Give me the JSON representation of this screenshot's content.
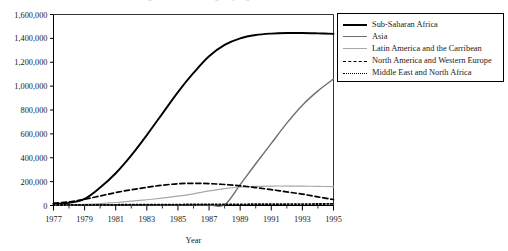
{
  "chart_data": {
    "type": "line",
    "title": "Figure 1. Number of Refugees by Region",
    "xlabel": "Year",
    "ylabel": "",
    "x": [
      1977,
      1978,
      1979,
      1980,
      1981,
      1982,
      1983,
      1984,
      1985,
      1986,
      1987,
      1988,
      1989,
      1990,
      1991,
      1992,
      1993,
      1994,
      1995
    ],
    "xlim": [
      1977,
      1995
    ],
    "ylim": [
      0,
      1600000
    ],
    "xticks": [
      1977,
      1979,
      1981,
      1983,
      1985,
      1987,
      1989,
      1991,
      1993,
      1995
    ],
    "xtick_labels": [
      "1977",
      "1979",
      "1981",
      "1983",
      "1985",
      "1987",
      "1989",
      "1991",
      "1993",
      "1995"
    ],
    "yticks": [
      0,
      200000,
      400000,
      600000,
      800000,
      1000000,
      1200000,
      1400000,
      1600000
    ],
    "ytick_labels": [
      "0",
      "200,000",
      "400,000",
      "600,000",
      "800,000",
      "1,000,000",
      "1,200,000",
      "1,400,000",
      "1,600,000"
    ],
    "grid": false,
    "legend_position": "top-right-outside",
    "series": [
      {
        "name": "Sub-Saharan Africa",
        "style": "solid-thick",
        "color": "#000000",
        "values": [
          15000,
          22000,
          55000,
          150000,
          270000,
          420000,
          590000,
          770000,
          950000,
          1110000,
          1250000,
          1345000,
          1400000,
          1428000,
          1440000,
          1445000,
          1445000,
          1442000,
          1438000
        ]
      },
      {
        "name": "Asia",
        "style": "solid-mid",
        "color": "#6e6e6e",
        "values": [
          4000,
          4000,
          4000,
          4000,
          4000,
          4000,
          4000,
          4000,
          4000,
          4000,
          4000,
          6000,
          175000,
          350000,
          520000,
          690000,
          840000,
          960000,
          1060000
        ]
      },
      {
        "name": "Latin America and the Carribean",
        "style": "solid-light",
        "color": "#a8a8a8",
        "values": [
          3000,
          5000,
          9000,
          16000,
          25000,
          36000,
          48000,
          62000,
          78000,
          98000,
          122000,
          142000,
          155000,
          161000,
          163000,
          163000,
          162000,
          160000,
          158000
        ]
      },
      {
        "name": "North America and Western Europe",
        "style": "dashed",
        "color": "#000000",
        "values": [
          18000,
          30000,
          52000,
          80000,
          108000,
          132000,
          152000,
          170000,
          182000,
          186000,
          183000,
          176000,
          165000,
          150000,
          133000,
          114000,
          95000,
          72000,
          50000
        ]
      },
      {
        "name": "Middle East and North Africa",
        "style": "dotted",
        "color": "#000000",
        "values": [
          4000,
          4500,
          5000,
          5500,
          6000,
          6500,
          7000,
          7500,
          8000,
          8500,
          9000,
          9500,
          10000,
          10500,
          11000,
          11500,
          12000,
          12500,
          13000
        ]
      }
    ]
  },
  "legend": {
    "items": [
      {
        "label": "Sub-Saharan Africa"
      },
      {
        "label": "Asia"
      },
      {
        "label": "Latin America and the Carribean"
      },
      {
        "label": "North America and Western Europe"
      },
      {
        "label": "Middle East and North Africa"
      }
    ]
  }
}
